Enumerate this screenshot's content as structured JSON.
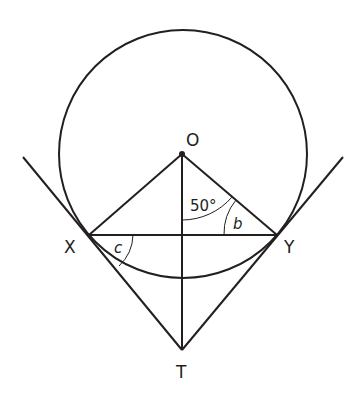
{
  "diagram": {
    "type": "circle-tangent-geometry",
    "points": {
      "O": {
        "label": "O",
        "x": 182,
        "y": 154
      },
      "X": {
        "label": "X",
        "x": 89,
        "y": 235
      },
      "Y": {
        "label": "Y",
        "x": 277,
        "y": 235
      },
      "T": {
        "label": "T",
        "x": 182,
        "y": 350
      }
    },
    "circle": {
      "center": "O",
      "cx": 183,
      "cy": 154,
      "r": 125
    },
    "segments": [
      "OX",
      "OY",
      "OT",
      "XY",
      "XT",
      "YT"
    ],
    "tangent_lines": [
      "TX extended",
      "TY extended"
    ],
    "angles": {
      "angle_TOY": {
        "label": "50°",
        "vertex": "O"
      },
      "angle_OYX": {
        "label": "b",
        "vertex": "Y"
      },
      "angle_TXY": {
        "label": "c",
        "vertex": "X"
      }
    },
    "colors": {
      "stroke": "#231f20",
      "background": "#ffffff"
    }
  }
}
